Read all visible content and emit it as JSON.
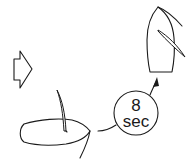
{
  "diagram": {
    "direction_arrow": {
      "icon": "right-arrow-icon",
      "meaning": "wind/direction indicator"
    },
    "boat_start": {
      "heading": "right",
      "icon": "sailboat-hull-icon"
    },
    "boat_end": {
      "heading": "up",
      "icon": "sailboat-hull-icon"
    },
    "timer": {
      "value": "8",
      "unit": "sec"
    },
    "colors": {
      "line": "#1a1a1a",
      "background": "#ffffff"
    }
  }
}
